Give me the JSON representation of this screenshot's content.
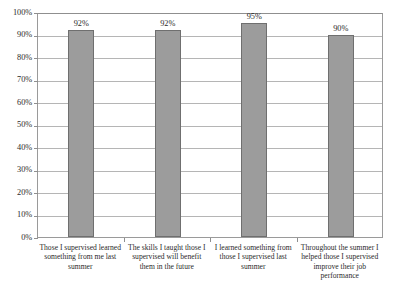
{
  "chart_data": {
    "type": "bar",
    "title": "",
    "subtitle": "",
    "xlabel": "",
    "ylabel": "",
    "ylim": [
      0,
      100
    ],
    "grid": true,
    "legend": false,
    "legend_position": "none",
    "value_suffix": "%",
    "bar_color": "#9c9c9c",
    "bar_border_color": "#6f6f6f",
    "gridline_color": "#b5b5b5",
    "axis_color": "#8f8f8f",
    "categories": [
      "Those I supervised learned something from me last summer",
      "The skills I taught those I supervised will benefit them in the future",
      "I learned something from those I supervised last summer",
      "Throughout the summer I helped those I supervised improve their job performance"
    ],
    "values": [
      92,
      92,
      95,
      90
    ],
    "data_labels": [
      "92%",
      "92%",
      "95%",
      "90%"
    ],
    "yticks": [
      0,
      10,
      20,
      30,
      40,
      50,
      60,
      70,
      80,
      90,
      100
    ],
    "ytick_labels": [
      "0%",
      "10%",
      "20%",
      "30%",
      "40%",
      "50%",
      "60%",
      "70%",
      "80%",
      "90%",
      "100%"
    ]
  }
}
